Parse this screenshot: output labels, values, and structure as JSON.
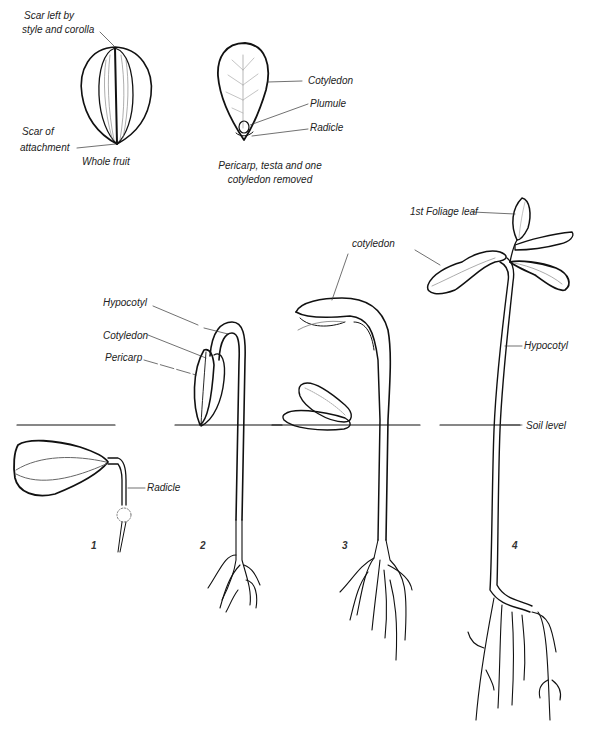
{
  "figure": {
    "colors": {
      "ink": "#111111",
      "leader": "#444444",
      "background": "#ffffff"
    }
  },
  "top_left": {
    "caption": "Whole fruit",
    "labels": {
      "scar_style_line1": "Scar left by",
      "scar_style_line2": "style and corolla",
      "scar_attach_line1": "Scar of",
      "scar_attach_line2": "attachment"
    }
  },
  "top_right": {
    "caption_line1": "Pericarp, testa and one",
    "caption_line2": "cotyledon  removed",
    "labels": {
      "cotyledon": "Cotyledon",
      "plumule": "Plumule",
      "radicle": "Radicle"
    }
  },
  "stages": [
    {
      "number": "1",
      "labels": {
        "radicle": "Radicle"
      }
    },
    {
      "number": "2",
      "labels": {
        "hypocotyl": "Hypocotyl",
        "cotyledon": "Cotyledon",
        "pericarp": "Pericarp"
      }
    },
    {
      "number": "3",
      "labels": {
        "cotyledon": "cotyledon"
      }
    },
    {
      "number": "4",
      "labels": {
        "foliage_leaf": "1st Foliage leaf",
        "hypocotyl": "Hypocotyl",
        "soil_level": "Soil level"
      }
    }
  ]
}
